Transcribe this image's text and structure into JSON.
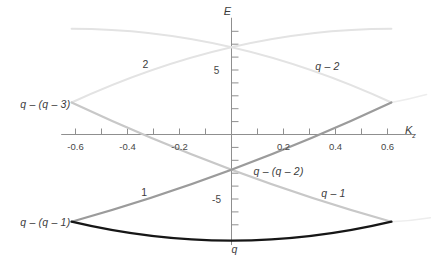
{
  "figure": {
    "background": "#ffffff",
    "axis_color": "#8f8f8f",
    "text_color": "#3c3c3c"
  },
  "chart_data": {
    "type": "line",
    "title": "",
    "x_axis": {
      "label_main": "K",
      "label_sub": "z",
      "range": [
        -0.655,
        0.7
      ],
      "ticks": [
        -0.6,
        -0.5,
        -0.4,
        -0.3,
        -0.2,
        -0.1,
        0.1,
        0.2,
        0.3,
        0.4,
        0.5,
        0.6
      ],
      "tick_labels": [
        {
          "k": -0.6,
          "text": "-0.6"
        },
        {
          "k": -0.4,
          "text": "-0.4"
        },
        {
          "k": -0.2,
          "text": "-0.2"
        },
        {
          "k": 0.2,
          "text": "0.2"
        },
        {
          "k": 0.4,
          "text": "0.4"
        },
        {
          "k": 0.6,
          "text": "0.6"
        }
      ]
    },
    "y_axis": {
      "label": "E",
      "range": [
        -8.57,
        9.05
      ],
      "ticks": [
        -7,
        -6,
        -5,
        -4,
        -3,
        -2,
        -1,
        1,
        2,
        3,
        4,
        5,
        6,
        7,
        8
      ],
      "tick_labels": [
        {
          "e": 5,
          "text": "5"
        },
        {
          "e": -5,
          "text": "-5"
        }
      ]
    },
    "zone_boundary_k": 0.615,
    "series": [
      {
        "name": "band-2-ghost",
        "color": "#ededed",
        "width": 1.6,
        "points": [
          [
            0.615,
            2.48
          ],
          [
            0.68,
            2.75
          ],
          [
            0.75,
            3.1
          ]
        ]
      },
      {
        "name": "band-q-1-ghost",
        "color": "#ededed",
        "width": 1.6,
        "points": [
          [
            0.615,
            -6.76
          ],
          [
            0.69,
            -6.65
          ],
          [
            0.765,
            -6.45
          ]
        ]
      },
      {
        "name": "band-2",
        "color": "#e3e3e3",
        "width": 2,
        "points": [
          [
            -0.615,
            2.48
          ],
          [
            0,
            6.77
          ],
          [
            0.615,
            8.2
          ]
        ]
      },
      {
        "name": "band-q-2",
        "color": "#e3e3e3",
        "width": 2,
        "points": [
          [
            -0.615,
            8.2
          ],
          [
            0,
            6.77
          ],
          [
            0.615,
            2.48
          ]
        ]
      },
      {
        "name": "band-q-1",
        "color": "#c8c8c8",
        "width": 2.2,
        "points": [
          [
            -0.615,
            2.48
          ],
          [
            0,
            -2.73
          ],
          [
            0.615,
            -6.76
          ]
        ]
      },
      {
        "name": "band-1",
        "color": "#9b9b9b",
        "width": 2.2,
        "points": [
          [
            -0.615,
            -6.76
          ],
          [
            0,
            -2.73
          ],
          [
            0.615,
            2.48
          ]
        ]
      },
      {
        "name": "band-q",
        "color": "#161616",
        "width": 2.4,
        "points": [
          [
            -0.615,
            -6.76
          ],
          [
            0,
            -8.23
          ],
          [
            0.615,
            -6.76
          ]
        ]
      }
    ],
    "annotations": [
      {
        "id": "label-band-2",
        "text": "2",
        "k": -0.331,
        "e": 5.49,
        "italic": false
      },
      {
        "id": "label-band-q-2",
        "text": "q – 2",
        "k": 0.369,
        "e": 5.33,
        "italic": true
      },
      {
        "id": "label-crossing-q-q-3",
        "text": "q – (q – 3)",
        "k": -0.716,
        "e": 2.39,
        "italic": true
      },
      {
        "id": "label-crossing-q-q-2",
        "text": "q – (q – 2)",
        "k": 0.181,
        "e": -2.85,
        "italic": true
      },
      {
        "id": "label-band-1",
        "text": "1",
        "k": -0.335,
        "e": -4.43,
        "italic": false
      },
      {
        "id": "label-band-q-1",
        "text": "q – 1",
        "k": 0.392,
        "e": -4.51,
        "italic": true
      },
      {
        "id": "label-crossing-q-q-1",
        "text": "q – (q – 1)",
        "k": -0.716,
        "e": -6.78,
        "italic": true
      },
      {
        "id": "label-band-q",
        "text": "q",
        "k": 0.012,
        "e": -8.87,
        "italic": true
      }
    ]
  }
}
